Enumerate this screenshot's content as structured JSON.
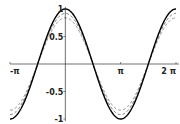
{
  "chart_data": {
    "type": "line",
    "title": "",
    "xlabel": "",
    "ylabel": "",
    "xlim": [
      -3.14159,
      6.28318
    ],
    "ylim": [
      -1,
      1
    ],
    "grid": false,
    "legend": null,
    "x_ticks": [
      {
        "value": -3.14159,
        "label": "-π"
      },
      {
        "value": 3.14159,
        "label": "π"
      },
      {
        "value": 6.28318,
        "label": "2 π"
      }
    ],
    "y_ticks": [
      {
        "value": 1,
        "label": "1"
      },
      {
        "value": 0.5,
        "label": "0.5"
      },
      {
        "value": -0.5,
        "label": "-0.5"
      },
      {
        "value": -1,
        "label": "-1"
      }
    ],
    "series": [
      {
        "name": "cos(x)",
        "style": "solid",
        "color": "#000000",
        "amplitude": 1.0,
        "period": 6.28318,
        "phase": 0
      },
      {
        "name": "approx-1",
        "style": "dashed",
        "color": "#555555",
        "amplitude": 0.92,
        "period": 6.28318,
        "phase": 0
      },
      {
        "name": "approx-2",
        "style": "dashed",
        "color": "#777777",
        "amplitude": 0.84,
        "period": 6.28318,
        "phase": 0
      }
    ],
    "sample_points": {
      "x": [
        -3.14159,
        -1.5708,
        0,
        1.5708,
        3.14159,
        4.71239,
        6.28318
      ],
      "cos": [
        -1,
        0,
        1,
        0,
        -1,
        0,
        1
      ]
    }
  }
}
